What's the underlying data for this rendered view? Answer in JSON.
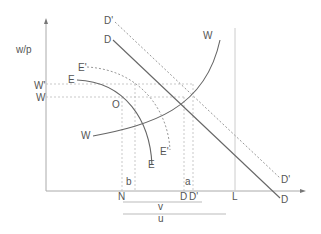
{
  "diagram": {
    "y_axis_label": "w/p",
    "y_ticks": {
      "w_prime": "W'",
      "w": "W"
    },
    "curves": {
      "d": "D",
      "d_end": "D",
      "d_prime": "D'",
      "d_prime_end": "D'",
      "w_top": "W",
      "w_left": "W",
      "e": "E",
      "e_end": "E",
      "e_prime": "E'",
      "e_prime_end": "E'"
    },
    "points": {
      "o": "O",
      "a": "a",
      "b": "b"
    },
    "x_ticks": {
      "n": "N",
      "d": "D",
      "d_prime": "D'",
      "l": "L"
    },
    "spans": {
      "v": "v",
      "u": "u"
    },
    "colors": {
      "line": "#666666",
      "dotted": "#999999",
      "axis": "#aaaaaa",
      "text": "#555555"
    }
  }
}
